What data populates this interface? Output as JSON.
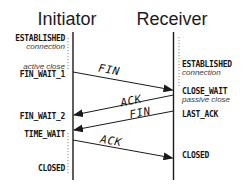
{
  "diagram": {
    "type": "sequence-diagram",
    "initiator": {
      "title": "Initiator",
      "states": [
        {
          "label": "ESTABLISHED"
        },
        {
          "label": "connection"
        },
        {
          "label": "active close"
        },
        {
          "label": "FIN_WAIT_1"
        },
        {
          "label": "FIN_WAIT_2"
        },
        {
          "label": "TIME_WAIT"
        },
        {
          "label": "CLOSED"
        }
      ]
    },
    "receiver": {
      "title": "Receiver",
      "states": [
        {
          "label": "ESTABLISHED"
        },
        {
          "label": "connection"
        },
        {
          "label": "CLOSE_WAIT"
        },
        {
          "label": "passive close"
        },
        {
          "label": "LAST_ACK"
        },
        {
          "label": "CLOSED"
        }
      ]
    },
    "messages": [
      {
        "label": "FIN",
        "from": "initiator",
        "to": "receiver"
      },
      {
        "label": "ACK",
        "from": "receiver",
        "to": "initiator"
      },
      {
        "label": "FIN",
        "from": "receiver",
        "to": "initiator"
      },
      {
        "label": "ACK",
        "from": "initiator",
        "to": "receiver"
      }
    ],
    "colors": {
      "line": "#1a1a1a",
      "text": "#161616",
      "dotted": "#8a8a8a",
      "background": "#ffffff"
    }
  }
}
